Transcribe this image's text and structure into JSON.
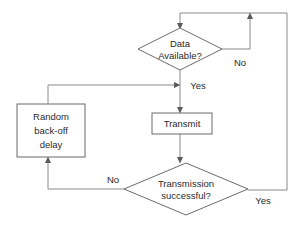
{
  "diagram": {
    "background_color": "#ffffff",
    "node_stroke_color": "#6b6b6b",
    "edge_stroke_color": "#8a8a8a",
    "text_color": "#2b2b2b",
    "nodes": {
      "data_available": {
        "type": "decision",
        "line1": "Data",
        "line2": "Available?"
      },
      "transmit": {
        "type": "process",
        "label": "Transmit"
      },
      "backoff": {
        "type": "process",
        "line1": "Random",
        "line2": "back-off",
        "line3": "delay"
      },
      "transmission_successful": {
        "type": "decision",
        "line1": "Transmission",
        "line2": "successful?"
      }
    },
    "edge_labels": {
      "data_available_no": "No",
      "data_available_yes": "Yes",
      "transmission_no": "No",
      "transmission_yes": "Yes"
    }
  }
}
